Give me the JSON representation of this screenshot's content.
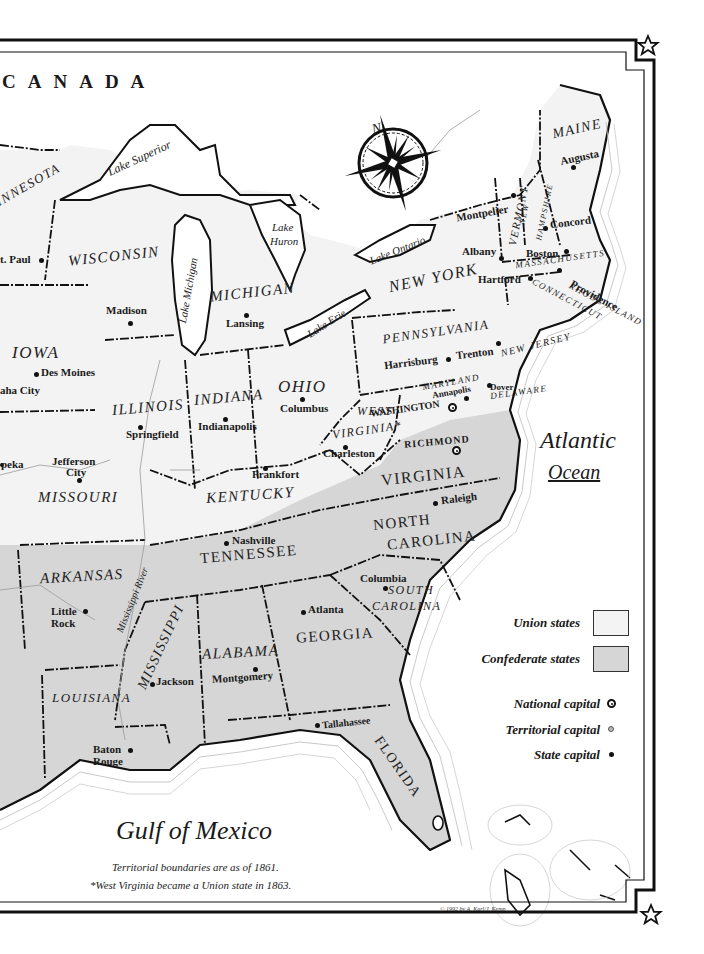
{
  "country_label": "CANADA",
  "compass": {
    "north_label": "N"
  },
  "colors": {
    "union": "#f3f3f3",
    "confederate": "#d6d6d6",
    "water": "#ffffff",
    "border": "#111111"
  },
  "states": [
    {
      "name": "MINNESOTA",
      "side": "union"
    },
    {
      "name": "WISCONSIN",
      "side": "union"
    },
    {
      "name": "MICHIGAN",
      "side": "union"
    },
    {
      "name": "IOWA",
      "side": "union"
    },
    {
      "name": "ILLINOIS",
      "side": "union"
    },
    {
      "name": "INDIANA",
      "side": "union"
    },
    {
      "name": "OHIO",
      "side": "union"
    },
    {
      "name": "MISSOURI",
      "side": "union"
    },
    {
      "name": "KENTUCKY",
      "side": "union"
    },
    {
      "name": "WEST VIRGINIA*",
      "side": "union"
    },
    {
      "name": "PENNSYLVANIA",
      "side": "union"
    },
    {
      "name": "NEW YORK",
      "side": "union"
    },
    {
      "name": "MARYLAND",
      "side": "union"
    },
    {
      "name": "DELAWARE",
      "side": "union"
    },
    {
      "name": "NEW JERSEY",
      "side": "union"
    },
    {
      "name": "CONNECTICUT",
      "side": "union"
    },
    {
      "name": "RHODE ISLAND",
      "side": "union"
    },
    {
      "name": "MASSACHUSETTS",
      "side": "union"
    },
    {
      "name": "VERMONT",
      "side": "union"
    },
    {
      "name": "NEW HAMPSHIRE",
      "side": "union"
    },
    {
      "name": "MAINE",
      "side": "union"
    },
    {
      "name": "VIRGINIA",
      "side": "confederate"
    },
    {
      "name": "NORTH CAROLINA",
      "side": "confederate"
    },
    {
      "name": "SOUTH CAROLINA",
      "side": "confederate"
    },
    {
      "name": "TENNESSEE",
      "side": "confederate"
    },
    {
      "name": "ARKANSAS",
      "side": "confederate"
    },
    {
      "name": "GEORGIA",
      "side": "confederate"
    },
    {
      "name": "ALABAMA",
      "side": "confederate"
    },
    {
      "name": "MISSISSIPPI",
      "side": "confederate"
    },
    {
      "name": "LOUISIANA",
      "side": "confederate"
    },
    {
      "name": "FLORIDA",
      "side": "confederate"
    }
  ],
  "labels": {
    "minnesota": "INNESOTA",
    "wisconsin": "WISCONSIN",
    "michigan": "MICHIGAN",
    "iowa": "IOWA",
    "illinois": "ILLINOIS",
    "indiana": "INDIANA",
    "ohio": "OHIO",
    "missouri": "MISSOURI",
    "kentucky": "KENTUCKY",
    "west": "WEST",
    "virginia_w": "VIRGINIA*",
    "pennsylvania": "PENNSYLVANIA",
    "new_york": "NEW YORK",
    "maryland": "MARYLAND",
    "delaware": "DELAWARE",
    "new_jersey": "NEW JERSEY",
    "connecticut": "CONNECTICUT",
    "rhode_island": "RHODE ISLAND",
    "massachusetts": "MASSACHUSETTS",
    "vermont": "VERMONT",
    "new_hampshire_1": "NEW",
    "new_hampshire_2": "HAMPSHIRE",
    "maine": "MAINE",
    "virginia": "VIRGINIA",
    "north_carolina_1": "NORTH",
    "north_carolina_2": "CAROLINA",
    "south_carolina_1": "SOUTH",
    "south_carolina_2": "CAROLINA",
    "tennessee": "TENNESSEE",
    "arkansas": "ARKANSAS",
    "georgia": "GEORGIA",
    "alabama": "ALABAMA",
    "mississippi": "MISSISSIPPI",
    "louisiana": "LOUISIANA",
    "florida": "FLORIDA"
  },
  "cities": {
    "st_paul": "t. Paul",
    "madison": "Madison",
    "lansing": "Lansing",
    "des_moines": "Des Moines",
    "omaha": "aha City",
    "springfield": "Springfield",
    "indianapolis": "Indianapolis",
    "columbus": "Columbus",
    "topeka": "peka",
    "jefferson_city_1": "Jefferson",
    "jefferson_city_2": "City",
    "frankfort": "Frankfort",
    "charleston": "Charleston",
    "harrisburg": "Harrisburg",
    "trenton": "Trenton",
    "annapolis": "Annapolis",
    "dover": "Dover",
    "washington": "WASHINGTON",
    "richmond": "RICHMOND",
    "raleigh": "Raleigh",
    "nashville": "Nashville",
    "columbia": "Columbia",
    "atlanta": "Atlanta",
    "little_rock_1": "Little",
    "little_rock_2": "Rock",
    "jackson": "Jackson",
    "montgomery": "Montgomery",
    "baton_rouge_1": "Baton",
    "baton_rouge_2": "Rouge",
    "tallahassee": "Tallahassee",
    "albany": "Albany",
    "montpelier": "Montpelier",
    "concord": "Concord",
    "augusta": "Augusta",
    "boston": "Boston",
    "hartford": "Hartford",
    "providence": "Providence"
  },
  "water": {
    "lake_superior": "Lake Superior",
    "lake_michigan": "Lake Michigan",
    "lake_huron_1": "Lake",
    "lake_huron_2": "Huron",
    "lake_erie": "Lake Erie",
    "lake_ontario": "Lake Ontario",
    "mississippi_river": "Mississippi River",
    "atlantic_1": "Atlantic",
    "atlantic_2": "Ocean",
    "gulf": "Gulf of Mexico"
  },
  "legend": {
    "union": "Union states",
    "confederate": "Confederate states",
    "national_capital": "National capital",
    "territorial_capital": "Territorial capital",
    "state_capital": "State capital"
  },
  "notes": {
    "line1": "Territorial boundaries are as of 1861.",
    "line2": "*West Virginia became a Union state in 1863.",
    "copyright": "© 1992 by A. Karl/J. Kemp"
  }
}
